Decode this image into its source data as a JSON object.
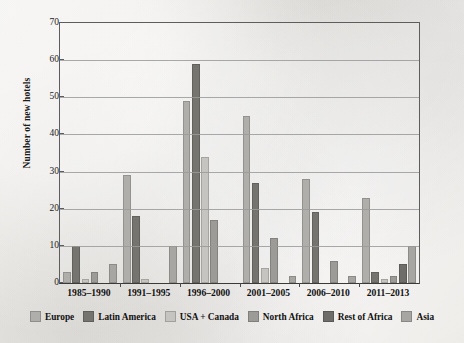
{
  "chart_data": {
    "type": "bar",
    "title": "",
    "xlabel": "",
    "ylabel": "Number of new hotels",
    "ylim": [
      0,
      70
    ],
    "ytick_step": 10,
    "yticks": [
      0,
      10,
      20,
      30,
      40,
      50,
      60,
      70
    ],
    "grid": true,
    "legend_position": "bottom",
    "categories": [
      "1985–1990",
      "1991–1995",
      "1996–2000",
      "2001–2005",
      "2006–2010",
      "2011–2013"
    ],
    "series": [
      {
        "name": "Europe",
        "color": "#b0aeab",
        "values": [
          3,
          29,
          49,
          45,
          28,
          23
        ]
      },
      {
        "name": "Latin America",
        "color": "#76746f",
        "values": [
          10,
          18,
          59,
          27,
          19,
          3
        ]
      },
      {
        "name": "USA + Canada",
        "color": "#c6c4c0",
        "values": [
          1,
          1,
          34,
          4,
          0,
          1
        ]
      },
      {
        "name": "North Africa",
        "color": "#9d9b97",
        "values": [
          3,
          0,
          17,
          12,
          6,
          2
        ]
      },
      {
        "name": "Rest of Africa",
        "color": "#6f6d69",
        "values": [
          0,
          0,
          0,
          0,
          0,
          5
        ]
      },
      {
        "name": "Asia",
        "color": "#a8a6a2",
        "values": [
          5,
          10,
          0,
          2,
          2,
          10
        ]
      }
    ]
  },
  "axis": {
    "y_title": "Number of new hotels"
  }
}
